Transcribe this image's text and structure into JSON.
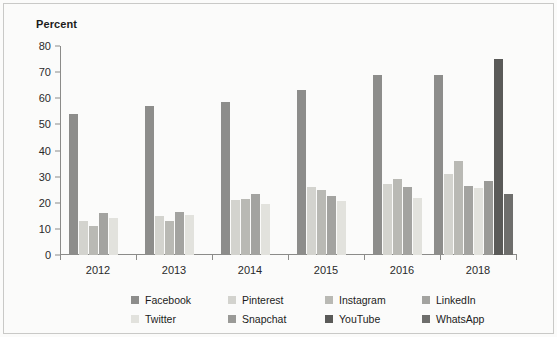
{
  "chart_data": {
    "type": "bar",
    "title": "",
    "subtitle": "",
    "xlabel": "",
    "ylabel": "Percent",
    "ylim": [
      0,
      80
    ],
    "yticks": [
      0,
      10,
      20,
      30,
      40,
      50,
      60,
      70,
      80
    ],
    "grid": false,
    "legend_position": "bottom",
    "categories": [
      "2012",
      "2013",
      "2014",
      "2015",
      "2016",
      "2018"
    ],
    "series": [
      {
        "name": "Facebook",
        "color": "#8d8d8b",
        "values": [
          54,
          57,
          58.5,
          63,
          69,
          69
        ]
      },
      {
        "name": "Pinterest",
        "color": "#d3d3ce",
        "values": [
          13,
          15,
          21,
          26,
          27,
          31
        ]
      },
      {
        "name": "Instagram",
        "color": "#b9b9b4",
        "values": [
          11,
          13,
          21.5,
          25,
          29,
          36
        ]
      },
      {
        "name": "LinkedIn",
        "color": "#a3a3a0",
        "values": [
          16,
          16.5,
          23.5,
          22.5,
          26,
          26.5
        ]
      },
      {
        "name": "Twitter",
        "color": "#e2e2dd",
        "values": [
          14,
          15.5,
          19.5,
          20.5,
          22,
          25.5
        ]
      },
      {
        "name": "Snapchat",
        "color": "#9a9a97",
        "values": [
          null,
          null,
          null,
          null,
          null,
          28.5
        ]
      },
      {
        "name": "YouTube",
        "color": "#5a5a58",
        "values": [
          null,
          null,
          null,
          null,
          null,
          75
        ]
      },
      {
        "name": "WhatsApp",
        "color": "#6e6e6c",
        "values": [
          null,
          null,
          null,
          null,
          null,
          23.5
        ]
      }
    ]
  },
  "legend": {
    "items": [
      {
        "label": "Facebook",
        "swatch": "#8d8d8b"
      },
      {
        "label": "Pinterest",
        "swatch": "#d3d3ce"
      },
      {
        "label": "Instagram",
        "swatch": "#b9b9b4"
      },
      {
        "label": "LinkedIn",
        "swatch": "#a3a3a0"
      },
      {
        "label": "Twitter",
        "swatch": "#e2e2dd"
      },
      {
        "label": "Snapchat",
        "swatch": "#9a9a97"
      },
      {
        "label": "YouTube",
        "swatch": "#5a5a58"
      },
      {
        "label": "WhatsApp",
        "swatch": "#6e6e6c"
      }
    ]
  },
  "axis": {
    "tick_color": "#8b8b89",
    "text_color": "#2a2a2a"
  },
  "frame": {
    "border_color": "#c9c9c7",
    "background": "#fbfbfa"
  }
}
